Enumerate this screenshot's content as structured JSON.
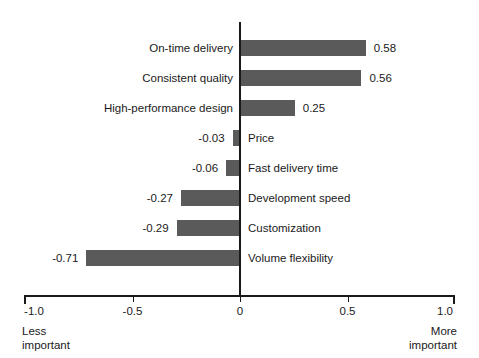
{
  "chart_data": {
    "type": "bar",
    "orientation": "horizontal",
    "title": "",
    "xlabel": "",
    "ylabel": "",
    "xlim": [
      -1.0,
      1.0
    ],
    "grid": false,
    "legend": null,
    "bar_color": "#5a5a5a",
    "axis_color": "#1a1a1a",
    "categories": [
      "On-time delivery",
      "Consistent quality",
      "High-performance design",
      "Price",
      "Fast delivery time",
      "Development speed",
      "Customization",
      "Volume flexibility"
    ],
    "values": [
      0.58,
      0.56,
      0.25,
      -0.03,
      -0.06,
      -0.27,
      -0.29,
      -0.71
    ],
    "value_labels": [
      "0.58",
      "0.56",
      "0.25",
      "-0.03",
      "-0.06",
      "-0.27",
      "-0.29",
      "-0.71"
    ],
    "ticks": [
      {
        "value": -1.0,
        "label": "-1.0"
      },
      {
        "value": -0.5,
        "label": "-0.5"
      },
      {
        "value": 0.0,
        "label": "0"
      },
      {
        "value": 0.5,
        "label": "0.5"
      },
      {
        "value": 1.0,
        "label": "1.0"
      }
    ],
    "annotations": {
      "left_line1": "Less",
      "left_line2": "important",
      "right_line1": "More",
      "right_line2": "important"
    }
  }
}
